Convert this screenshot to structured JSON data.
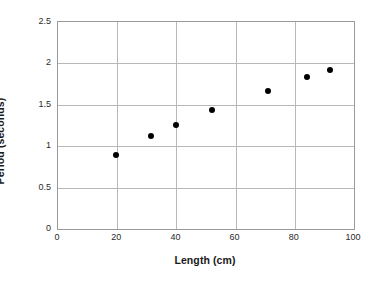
{
  "chart_data": {
    "type": "scatter",
    "title": "",
    "xlabel": "Length (cm)",
    "ylabel": "Period (seconds)",
    "xlim": [
      0,
      100
    ],
    "ylim": [
      0,
      2.5
    ],
    "xticks": [
      0,
      20,
      40,
      60,
      80,
      100
    ],
    "yticks": [
      0,
      0.5,
      1,
      1.5,
      2,
      2.5
    ],
    "xtick_labels": [
      "0",
      "20",
      "40",
      "60",
      "80",
      "100"
    ],
    "ytick_labels": [
      "0",
      "0.5",
      "1",
      "1.5",
      "2",
      "2.5"
    ],
    "grid": true,
    "grid_axes": "both",
    "legend": false,
    "marker": "filled-circle",
    "marker_color": "#000000",
    "grid_color": "#b8b8b8",
    "frame_color": "#9a9a9a",
    "background_color": "#ffffff",
    "series": [
      {
        "name": "Pendulum measurements",
        "points": [
          {
            "x": 19.5,
            "y": 0.89
          },
          {
            "x": 31.5,
            "y": 1.12
          },
          {
            "x": 40.0,
            "y": 1.26
          },
          {
            "x": 52.0,
            "y": 1.44
          },
          {
            "x": 71.0,
            "y": 1.67
          },
          {
            "x": 84.0,
            "y": 1.84
          },
          {
            "x": 92.0,
            "y": 1.92
          }
        ]
      }
    ]
  }
}
